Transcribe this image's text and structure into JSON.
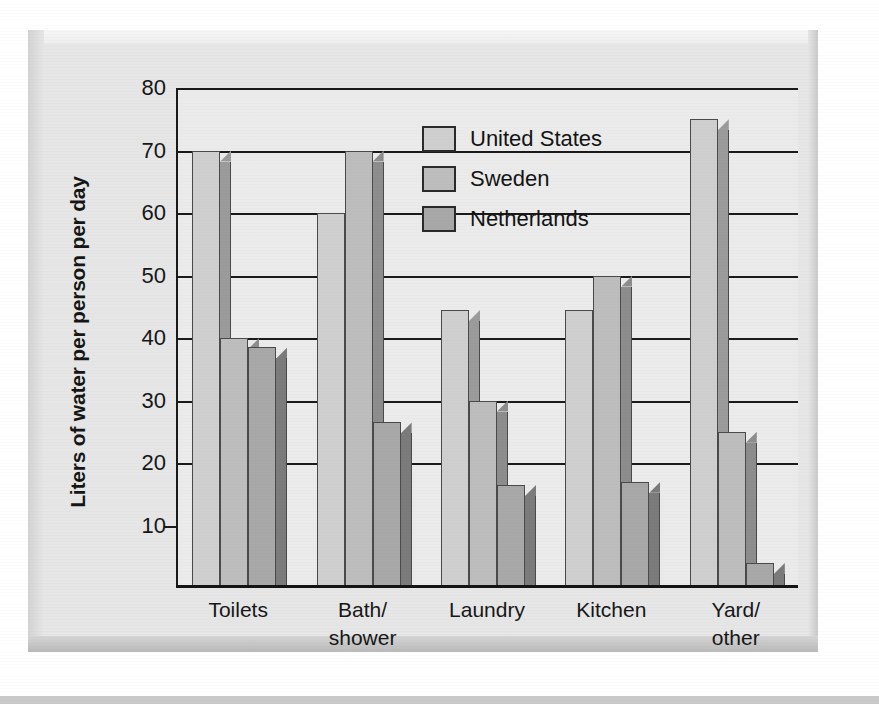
{
  "figure": {
    "frame_style": "beveled-3d-gray"
  },
  "colors": {
    "united_states": "#cfcfcf",
    "united_states_side": "#9b9b9b",
    "sweden": "#bdbdbd",
    "sweden_side": "#8d8d8d",
    "netherlands": "#a8a8a8",
    "netherlands_side": "#7b7b7b",
    "plot_background": "#ebebeb",
    "axis": "#1a1a1a",
    "frame": "#e3e3e3"
  },
  "chart_data": {
    "type": "bar",
    "title": "",
    "xlabel": "",
    "ylabel": "Liters of water per person per day",
    "ylim": [
      0,
      80
    ],
    "yticks": [
      10,
      20,
      30,
      40,
      50,
      60,
      70,
      80
    ],
    "ytick_labels": [
      "10",
      "20",
      "30",
      "40",
      "50",
      "60",
      "70",
      "80"
    ],
    "grid": true,
    "legend_position": "upper center",
    "categories": [
      "Toilets",
      "Bath/\nshower",
      "Laundry",
      "Kitchen",
      "Yard/\nother"
    ],
    "category_lines": [
      [
        "Toilets"
      ],
      [
        "Bath/",
        "shower"
      ],
      [
        "Laundry"
      ],
      [
        "Kitchen"
      ],
      [
        "Yard/",
        "other"
      ]
    ],
    "series": [
      {
        "name": "United States",
        "values": [
          70,
          60,
          44.5,
          44.5,
          75
        ]
      },
      {
        "name": "Sweden",
        "values": [
          40,
          70,
          30,
          50,
          25
        ]
      },
      {
        "name": "Netherlands",
        "values": [
          38.5,
          26.5,
          16.5,
          17,
          4
        ]
      }
    ]
  }
}
